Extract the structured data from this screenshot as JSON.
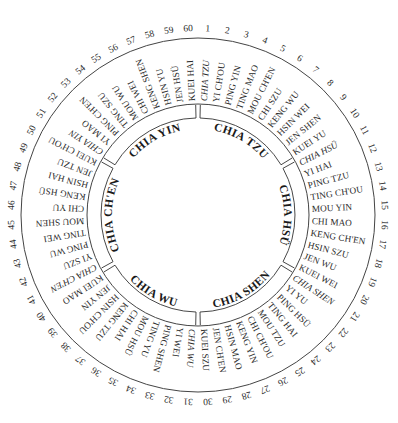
{
  "diagram": {
    "colors": {
      "ink": "#2a2a2a",
      "ring": "#444444",
      "background": "#ffffff"
    },
    "cycle": [
      {
        "n": "1",
        "name": "CHIA TZU",
        "italic": true
      },
      {
        "n": "2",
        "name": "YI CH'OU"
      },
      {
        "n": "3",
        "name": "PING YIN"
      },
      {
        "n": "4",
        "name": "TING MAO"
      },
      {
        "n": "5",
        "name": "MOU CH'EN"
      },
      {
        "n": "6",
        "name": "CHI SZU"
      },
      {
        "n": "7",
        "name": "KENG WU"
      },
      {
        "n": "8",
        "name": "HSIN WEI"
      },
      {
        "n": "9",
        "name": "JEN SHEN"
      },
      {
        "n": "10",
        "name": "KUEI YU"
      },
      {
        "n": "11",
        "name": "CHIA HSÜ",
        "italic": true
      },
      {
        "n": "12",
        "name": "YI HAI"
      },
      {
        "n": "13",
        "name": "PING TZU"
      },
      {
        "n": "14",
        "name": "TING CH'OU"
      },
      {
        "n": "15",
        "name": "MOU YIN"
      },
      {
        "n": "16",
        "name": "CHI MAO"
      },
      {
        "n": "17",
        "name": "KENG CH'EN"
      },
      {
        "n": "18",
        "name": "HSIN SZU"
      },
      {
        "n": "19",
        "name": "JEN WU"
      },
      {
        "n": "20",
        "name": "KUEI WEI"
      },
      {
        "n": "21",
        "name": "CHIA SHEN",
        "italic": true
      },
      {
        "n": "22",
        "name": "YI YU"
      },
      {
        "n": "23",
        "name": "PING HSÜ"
      },
      {
        "n": "24",
        "name": "TING HAI"
      },
      {
        "n": "25",
        "name": "MOU TZU"
      },
      {
        "n": "26",
        "name": "CHI CH'OU"
      },
      {
        "n": "27",
        "name": "KENG YIN"
      },
      {
        "n": "28",
        "name": "HSIN MAO"
      },
      {
        "n": "29",
        "name": "JEN CH'EN"
      },
      {
        "n": "30",
        "name": "KUEI SZU"
      },
      {
        "n": "31",
        "name": "CHIA WU",
        "italic": true
      },
      {
        "n": "32",
        "name": "YI WEI"
      },
      {
        "n": "33",
        "name": "PING SHEN"
      },
      {
        "n": "34",
        "name": "TING YU"
      },
      {
        "n": "35",
        "name": "MOU HSÜ"
      },
      {
        "n": "36",
        "name": "CHI HAI"
      },
      {
        "n": "37",
        "name": "KENG TZU"
      },
      {
        "n": "38",
        "name": "HSIN CH'OU"
      },
      {
        "n": "39",
        "name": "JEN YIN"
      },
      {
        "n": "40",
        "name": "KUEI MAO"
      },
      {
        "n": "41",
        "name": "CHIA CH'EN",
        "italic": true
      },
      {
        "n": "42",
        "name": "YI SZU"
      },
      {
        "n": "43",
        "name": "PING WU"
      },
      {
        "n": "44",
        "name": "TING WEI"
      },
      {
        "n": "45",
        "name": "MOU SHEN"
      },
      {
        "n": "46",
        "name": "CHI YU"
      },
      {
        "n": "47",
        "name": "KENG HSÜ"
      },
      {
        "n": "48",
        "name": "HSIN HAI"
      },
      {
        "n": "49",
        "name": "JEN TZU"
      },
      {
        "n": "50",
        "name": "KUEI CH'OU"
      },
      {
        "n": "51",
        "name": "CHIA YIN",
        "italic": true
      },
      {
        "n": "52",
        "name": "YI MAO"
      },
      {
        "n": "53",
        "name": "PING CH'EN"
      },
      {
        "n": "54",
        "name": "TING SZU"
      },
      {
        "n": "55",
        "name": "MOU WU"
      },
      {
        "n": "56",
        "name": "CHI WEI"
      },
      {
        "n": "57",
        "name": "KENG SHEN"
      },
      {
        "n": "58",
        "name": "HSIN YU"
      },
      {
        "n": "59",
        "name": "JEN HSÜ"
      },
      {
        "n": "60",
        "name": "KUEI HAI"
      }
    ],
    "groups": [
      {
        "label": "CHIA TZU",
        "start": 1
      },
      {
        "label": "CHIA HSÜ",
        "start": 11
      },
      {
        "label": "CHIA SHEN",
        "start": 21
      },
      {
        "label": "CHIA WU",
        "start": 31
      },
      {
        "label": "CHIA CH'EN",
        "start": 41
      },
      {
        "label": "CHIA YIN",
        "start": 51
      }
    ]
  }
}
